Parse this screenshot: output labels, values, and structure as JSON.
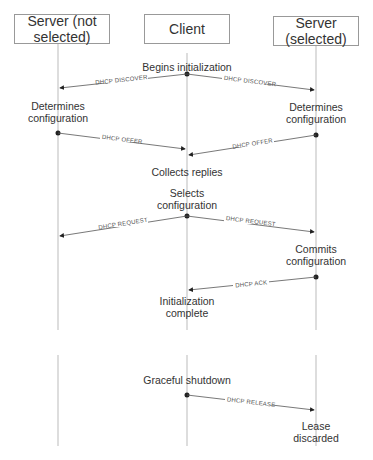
{
  "participants": [
    {
      "id": "server_not_selected",
      "label": "Server (not\nselected)"
    },
    {
      "id": "client",
      "label": "Client"
    },
    {
      "id": "server_selected",
      "label": "Server\n(selected)"
    }
  ],
  "events": [
    {
      "id": "begins",
      "label": "Begins initialization"
    },
    {
      "id": "det_left",
      "label": "Determines\nconfiguration"
    },
    {
      "id": "det_right",
      "label": "Determines\nconfiguration"
    },
    {
      "id": "collects",
      "label": "Collects replies"
    },
    {
      "id": "selects",
      "label": "Selects\nconfiguration"
    },
    {
      "id": "commits",
      "label": "Commits\nconfiguration"
    },
    {
      "id": "init_complete",
      "label": "Initialization\ncomplete"
    },
    {
      "id": "graceful",
      "label": "Graceful shutdown"
    },
    {
      "id": "lease",
      "label": "Lease discarded"
    }
  ],
  "messages": [
    {
      "id": "discover_left",
      "label": "DHCP DISCOVER"
    },
    {
      "id": "discover_right",
      "label": "DHCP DISCOVER"
    },
    {
      "id": "offer_left",
      "label": "DHCP OFFER"
    },
    {
      "id": "offer_right",
      "label": "DHCP OFFER"
    },
    {
      "id": "request_left",
      "label": "DHCP REQUEST"
    },
    {
      "id": "request_right",
      "label": "DHCP REQUEST"
    },
    {
      "id": "ack",
      "label": "DHCP ACK"
    },
    {
      "id": "release",
      "label": "DHCP RELEASE"
    }
  ]
}
